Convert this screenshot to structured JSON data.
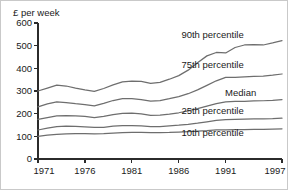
{
  "chart_data": {
    "type": "line",
    "title": "",
    "subtitle": "",
    "xlabel": "",
    "ylabel": "£ per week",
    "ylim": [
      0,
      600
    ],
    "xlim": [
      1971,
      1997
    ],
    "grid": false,
    "legend_position": "inline-right-of-each-line",
    "yticks": [
      0,
      100,
      200,
      300,
      400,
      500,
      600
    ],
    "ytick_labels": [
      "0",
      "100",
      "200",
      "300",
      "400",
      "500",
      "600"
    ],
    "xticks": [
      1971,
      1976,
      1981,
      1986,
      1991,
      1997
    ],
    "xtick_labels": [
      "1971",
      "1976",
      "1981",
      "1986",
      "1991",
      "1997"
    ],
    "x": [
      1971,
      1972,
      1973,
      1974,
      1975,
      1976,
      1977,
      1978,
      1979,
      1980,
      1981,
      1982,
      1983,
      1984,
      1985,
      1986,
      1987,
      1988,
      1989,
      1990,
      1991,
      1992,
      1993,
      1994,
      1995,
      1996,
      1997
    ],
    "series": [
      {
        "name": "90th percentile",
        "label": "90th percentile",
        "color": "#6e6e6e",
        "values": [
          300,
          313,
          326,
          322,
          313,
          305,
          298,
          311,
          327,
          340,
          344,
          342,
          334,
          338,
          352,
          368,
          392,
          425,
          455,
          470,
          468,
          492,
          503,
          505,
          503,
          512,
          522
        ]
      },
      {
        "name": "75th percentile",
        "label": "75th percentile",
        "color": "#6e6e6e",
        "values": [
          230,
          243,
          252,
          249,
          244,
          240,
          234,
          245,
          258,
          266,
          266,
          262,
          255,
          258,
          266,
          275,
          288,
          305,
          325,
          345,
          360,
          360,
          362,
          364,
          366,
          370,
          375
        ]
      },
      {
        "name": "Median",
        "label": "Median",
        "color": "#6e6e6e",
        "values": [
          175,
          183,
          190,
          191,
          190,
          188,
          183,
          188,
          196,
          201,
          202,
          199,
          192,
          194,
          198,
          204,
          212,
          222,
          233,
          244,
          252,
          254,
          254,
          256,
          257,
          259,
          262
        ]
      },
      {
        "name": "25th percentile",
        "label": "25th percentile",
        "color": "#6e6e6e",
        "values": [
          128,
          136,
          143,
          145,
          144,
          142,
          139,
          140,
          145,
          147,
          147,
          146,
          143,
          143,
          146,
          149,
          153,
          158,
          164,
          170,
          174,
          175,
          176,
          177,
          177,
          178,
          180
        ]
      },
      {
        "name": "10th percentile",
        "label": "10th percentile",
        "color": "#6e6e6e",
        "values": [
          100,
          105,
          109,
          111,
          112,
          112,
          111,
          112,
          114,
          116,
          117,
          117,
          116,
          116,
          117,
          119,
          121,
          123,
          125,
          128,
          129,
          130,
          130,
          131,
          131,
          132,
          133
        ]
      }
    ],
    "annotations": [
      {
        "text": "90th percentile",
        "x": 1989.6,
        "y": 548
      },
      {
        "text": "75th percentile",
        "x": 1989.6,
        "y": 418
      },
      {
        "text": "Median",
        "x": 1992.6,
        "y": 292
      },
      {
        "text": "25th percentile",
        "x": 1989.6,
        "y": 212
      },
      {
        "text": "10th percentile",
        "x": 1989.6,
        "y": 118
      }
    ]
  },
  "colors": {
    "line": "#6e6e6e",
    "axis": "#2b2b2b",
    "text": "#1a1a1a",
    "background": "#ffffff",
    "border": "#c9c9c9"
  }
}
